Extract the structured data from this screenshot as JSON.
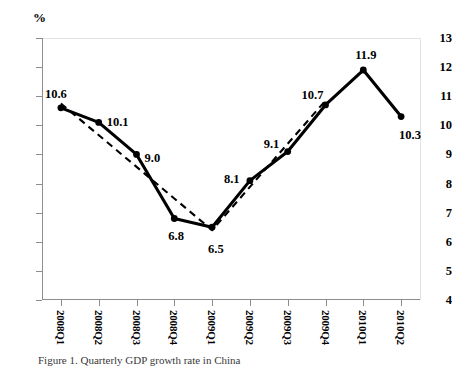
{
  "chart_data": {
    "type": "line",
    "title": "",
    "subtitle": "",
    "xlabel": "",
    "ylabel": "%",
    "unit_label": "%",
    "categories": [
      "2008Q1",
      "2008Q2",
      "2008Q3",
      "2008Q4",
      "2009Q1",
      "2009Q2",
      "2009Q3",
      "2009Q4",
      "2010Q1",
      "2010Q2"
    ],
    "values": [
      10.6,
      10.1,
      9.0,
      6.8,
      6.5,
      8.1,
      9.1,
      10.7,
      11.9,
      10.3
    ],
    "point_labels": [
      "10.6",
      "10.1",
      "9.0",
      "6.8",
      "6.5",
      "8.1",
      "9.1",
      "10.7",
      "11.9",
      "10.3"
    ],
    "ylim": [
      4,
      13
    ],
    "ytick_labels": [
      "13",
      "12",
      "11",
      "10",
      "9",
      "8",
      "7",
      "6",
      "5",
      "4"
    ],
    "ytick_values": [
      13,
      12,
      11,
      10,
      9,
      8,
      7,
      6,
      5,
      4
    ],
    "grid": false,
    "legend": "none",
    "series": [
      {
        "name": "quarterly-rate",
        "style": "solid-with-markers",
        "color": "#000000",
        "values": [
          10.6,
          10.1,
          9.0,
          6.8,
          6.5,
          8.1,
          9.1,
          10.7,
          11.9,
          10.3
        ]
      },
      {
        "name": "trend-dashed",
        "style": "dashed",
        "color": "#000000",
        "note": "dashed reference segments spanning 2008Q1 to 2009Q4",
        "vertices": [
          {
            "x": "2008Q1",
            "y": 10.75
          },
          {
            "x": "2009Q1",
            "y": 6.4
          },
          {
            "x": "2009Q4",
            "y": 10.85
          }
        ]
      }
    ],
    "caption": "Figure 1. Quarterly GDP growth rate in China"
  }
}
